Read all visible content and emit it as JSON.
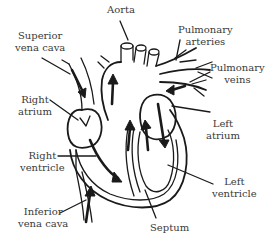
{
  "diagram": {
    "labels": {
      "aorta": [
        "Aorta"
      ],
      "superior_vena_cava": [
        "Superior",
        "vena cava"
      ],
      "pulmonary_arteries": [
        "Pulmonary",
        "arteries"
      ],
      "pulmonary_veins": [
        "Pulmonary",
        "veins"
      ],
      "right_atrium": [
        "Right",
        "atrium"
      ],
      "left_atrium": [
        "Left",
        "atrium"
      ],
      "right_ventricle": [
        "Right",
        "ventricle"
      ],
      "left_ventricle": [
        "Left",
        "ventricle"
      ],
      "inferior_vena_cava": [
        "Inferior",
        "vena cava"
      ],
      "septum": [
        "Septum"
      ]
    },
    "colors": {
      "line": "#1a1a1a",
      "text": "#3a3a3a",
      "background": "#ffffff"
    }
  }
}
